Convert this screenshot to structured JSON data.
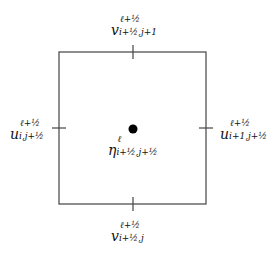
{
  "diagram": {
    "type": "staggered grid cell",
    "cell": {
      "x": 59,
      "y": 52,
      "width": 147,
      "height": 152,
      "stroke": "#444444"
    },
    "center_point": {
      "x": 133,
      "y": 129,
      "radius": 4.5,
      "color": "#000000"
    },
    "labels": {
      "top": {
        "base": "v",
        "sup": "ℓ+½",
        "sub": "i+½,j+1"
      },
      "bottom": {
        "base": "v",
        "sup": "ℓ+½",
        "sub": "i+½,j"
      },
      "left": {
        "base": "u",
        "sup": "ℓ+½",
        "sub": "i,j+½"
      },
      "right": {
        "base": "u",
        "sup": "ℓ+½",
        "sub": "i+1,j+½"
      },
      "center": {
        "base": "η",
        "sup": "ℓ",
        "sub": "i+½,j+½"
      }
    }
  }
}
